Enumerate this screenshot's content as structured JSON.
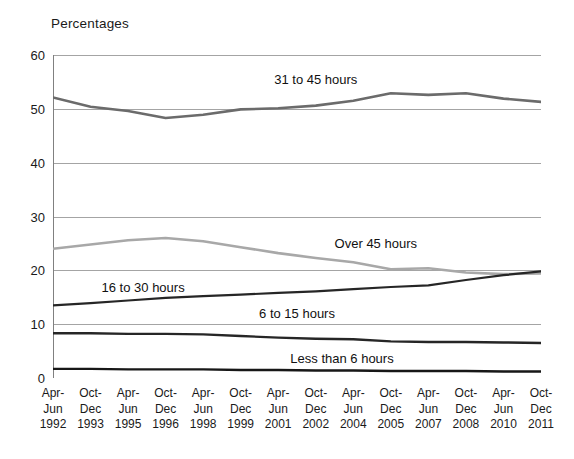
{
  "chart_data": {
    "type": "line",
    "title": "Percentages",
    "xlabel": "",
    "ylabel": "",
    "ylim": [
      0,
      60
    ],
    "yticks": [
      0,
      10,
      20,
      30,
      40,
      50,
      60
    ],
    "grid": true,
    "legend_position": "inline-annotations",
    "categories": [
      "Apr-\nJun\n1992",
      "Oct-\nDec\n1993",
      "Apr-\nJun\n1995",
      "Oct-\nDec\n1996",
      "Apr-\nJun\n1998",
      "Oct-\nDec\n1999",
      "Apr-\nJun\n2001",
      "Oct-\nDec\n2002",
      "Apr-\nJun\n2004",
      "Oct-\nDec\n2005",
      "Apr-\nJun\n2007",
      "Oct-\nDec\n2008",
      "Apr-\nJun\n2010",
      "Oct-\nDec\n2011"
    ],
    "category_lines": [
      [
        "Apr-",
        "Jun",
        "1992"
      ],
      [
        "Oct-",
        "Dec",
        "1993"
      ],
      [
        "Apr-",
        "Jun",
        "1995"
      ],
      [
        "Oct-",
        "Dec",
        "1996"
      ],
      [
        "Apr-",
        "Jun",
        "1998"
      ],
      [
        "Oct-",
        "Dec",
        "1999"
      ],
      [
        "Apr-",
        "Jun",
        "2001"
      ],
      [
        "Oct-",
        "Dec",
        "2002"
      ],
      [
        "Apr-",
        "Jun",
        "2004"
      ],
      [
        "Oct-",
        "Dec",
        "2005"
      ],
      [
        "Apr-",
        "Jun",
        "2007"
      ],
      [
        "Oct-",
        "Dec",
        "2008"
      ],
      [
        "Apr-",
        "Jun",
        "2010"
      ],
      [
        "Oct-",
        "Dec",
        "2011"
      ]
    ],
    "series": [
      {
        "name": "31 to 45 hours",
        "color": "#6b6b6b",
        "width": 2.6,
        "label_x_index": 7.0,
        "label_y": 55.6,
        "values": [
          52.1,
          50.4,
          49.6,
          48.3,
          48.9,
          49.9,
          50.1,
          50.6,
          51.5,
          52.9,
          52.6,
          52.9,
          51.9,
          51.3
        ]
      },
      {
        "name": "Over 45 hours",
        "color": "#a8a8a8",
        "width": 2.6,
        "label_x_index": 8.6,
        "label_y": 25.0,
        "values": [
          24.0,
          24.8,
          25.6,
          26.0,
          25.4,
          24.3,
          23.2,
          22.3,
          21.5,
          20.2,
          20.4,
          19.6,
          19.3,
          19.4
        ]
      },
      {
        "name": "16 to 30 hours",
        "color": "#262626",
        "width": 2.2,
        "label_x_index": 2.4,
        "label_y": 16.9,
        "values": [
          13.5,
          13.9,
          14.4,
          14.9,
          15.2,
          15.5,
          15.8,
          16.1,
          16.5,
          16.9,
          17.2,
          18.2,
          19.1,
          19.8
        ]
      },
      {
        "name": "6 to 15 hours",
        "color": "#262626",
        "width": 2.4,
        "label_x_index": 6.5,
        "label_y": 12.0,
        "values": [
          8.3,
          8.3,
          8.2,
          8.2,
          8.1,
          7.8,
          7.5,
          7.3,
          7.2,
          6.8,
          6.7,
          6.7,
          6.6,
          6.5
        ]
      },
      {
        "name": "Less than 6 hours",
        "color": "#171717",
        "width": 2.4,
        "label_x_index": 7.7,
        "label_y": 3.8,
        "values": [
          1.7,
          1.7,
          1.6,
          1.6,
          1.6,
          1.5,
          1.5,
          1.4,
          1.4,
          1.3,
          1.3,
          1.3,
          1.2,
          1.2
        ]
      }
    ],
    "axis_color": "#808080",
    "grid_color": "#9a9a9a"
  }
}
